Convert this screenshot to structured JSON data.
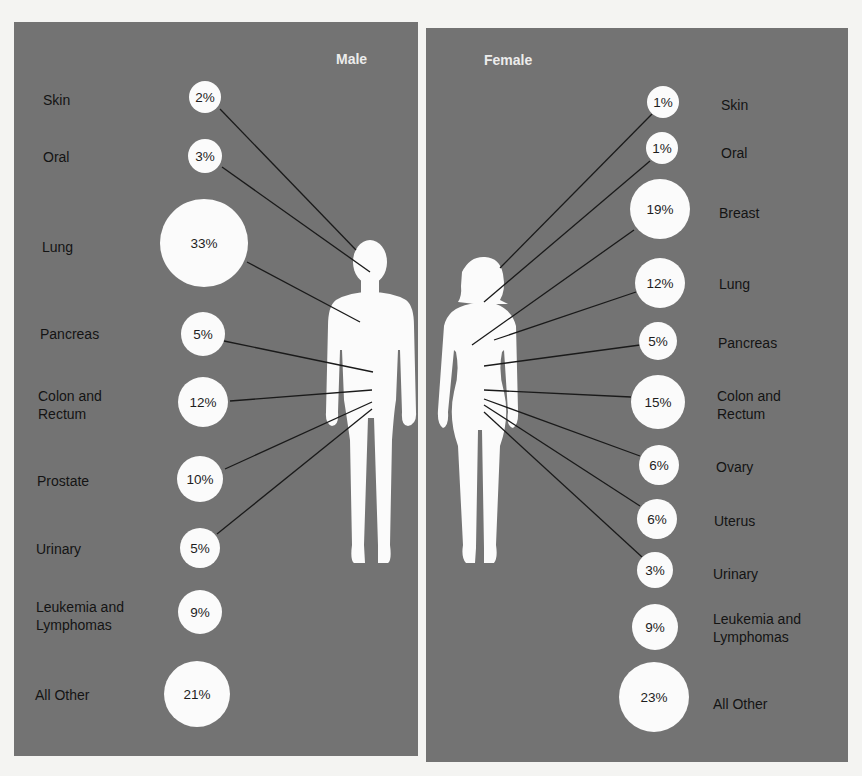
{
  "colors": {
    "page_background": "#f4f4f2",
    "panel_background": "#737373",
    "figure_fill": "#fbfbfb",
    "bubble_fill": "#fbfbfb",
    "leader_line": "#1a1a1a",
    "label_text": "#141414",
    "title_text": "#ececec"
  },
  "male": {
    "title": "Male",
    "items": [
      {
        "label": "Skin",
        "value": "2%"
      },
      {
        "label": "Oral",
        "value": "3%"
      },
      {
        "label": "Lung",
        "value": "33%"
      },
      {
        "label": "Pancreas",
        "value": "5%"
      },
      {
        "label": "Colon and\nRectum",
        "value": "12%"
      },
      {
        "label": "Prostate",
        "value": "10%"
      },
      {
        "label": "Urinary",
        "value": "5%"
      },
      {
        "label": "Leukemia and\nLymphomas",
        "value": "9%"
      },
      {
        "label": "All Other",
        "value": "21%"
      }
    ]
  },
  "female": {
    "title": "Female",
    "items": [
      {
        "label": "Skin",
        "value": "1%"
      },
      {
        "label": "Oral",
        "value": "1%"
      },
      {
        "label": "Breast",
        "value": "19%"
      },
      {
        "label": "Lung",
        "value": "12%"
      },
      {
        "label": "Pancreas",
        "value": "5%"
      },
      {
        "label": "Colon and\nRectum",
        "value": "15%"
      },
      {
        "label": "Ovary",
        "value": "6%"
      },
      {
        "label": "Uterus",
        "value": "6%"
      },
      {
        "label": "Urinary",
        "value": "3%"
      },
      {
        "label": "Leukemia and\nLymphomas",
        "value": "9%"
      },
      {
        "label": "All Other",
        "value": "23%"
      }
    ]
  }
}
